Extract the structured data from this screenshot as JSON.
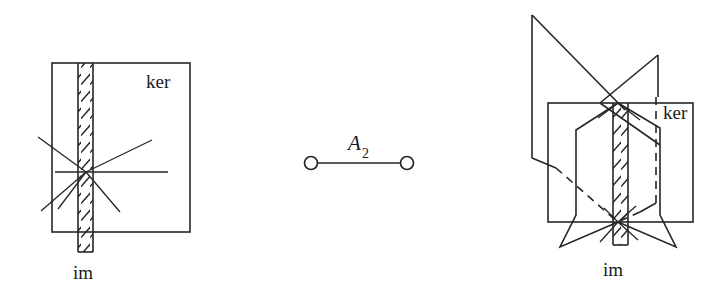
{
  "figure": {
    "background_color": "#ffffff",
    "line_color": "#262626",
    "panels": [
      {
        "id": "left-panel",
        "name": "2d-kernel-image-diagram",
        "labels": {
          "ker": "ker",
          "im": "im"
        }
      },
      {
        "id": "center-panel",
        "name": "dynkin-diagram-a2",
        "labels": {
          "name": "A",
          "subscript": "2"
        },
        "nodes": 2,
        "edges": 1
      },
      {
        "id": "right-panel",
        "name": "3d-kernel-image-diagram",
        "labels": {
          "ker": "ker",
          "im": "im"
        }
      }
    ]
  },
  "left_panel": {
    "square": {
      "x": 52,
      "y": 63,
      "width": 138,
      "height": 169
    },
    "strip": {
      "x": 78,
      "y": 63,
      "width": 15,
      "height": 189
    },
    "strip_hatch_count": 11,
    "center": {
      "x": 86,
      "y": 172
    },
    "rays": 6,
    "ker_label": {
      "text": "ker",
      "x": 146,
      "y": 88
    },
    "im_label": {
      "text": "im",
      "x": 73,
      "y": 279
    }
  },
  "center_panel": {
    "node_left": {
      "cx": 311,
      "cy": 163,
      "r": 6.5
    },
    "node_right": {
      "cx": 407,
      "cy": 163,
      "r": 6.5
    },
    "edge": {
      "x1": 317.5,
      "y1": 163,
      "x2": 400.5,
      "y2": 163
    },
    "label_main": {
      "text": "A",
      "x": 348,
      "y": 150
    },
    "label_sub": {
      "text": "2",
      "x": 362,
      "y": 157
    }
  },
  "right_panel": {
    "square": {
      "x": 548,
      "y": 103,
      "width": 145,
      "height": 119
    },
    "strip": {
      "x": 613,
      "y": 103,
      "width": 15,
      "height": 142
    },
    "strip_hatch_count": 9,
    "top_crossing": {
      "x": 618,
      "y": 103
    },
    "bottom_crossing": {
      "x": 618,
      "y": 222
    },
    "ker_label": {
      "text": "ker",
      "x": 663,
      "y": 119
    },
    "im_label": {
      "text": "im",
      "x": 603,
      "y": 276
    },
    "plane_a_apex": {
      "x": 532,
      "y": 15
    },
    "plane_b_apex": {
      "x": 658,
      "y": 55
    },
    "dashed_vertical": {
      "x": 656,
      "y1": 96,
      "y2": 202
    }
  }
}
